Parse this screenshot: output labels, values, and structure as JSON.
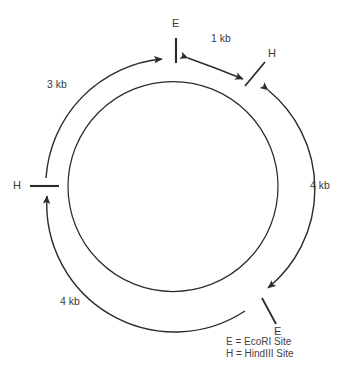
{
  "figure": {
    "type": "plasmid-restriction-map",
    "shape": "circular",
    "stroke_color": "#2b2b2b",
    "text_color": "#3a3a3a"
  },
  "sites": [
    {
      "id": "e-top",
      "label": "E",
      "enzyme": "EcoRI",
      "position": "top",
      "tick": "vertical"
    },
    {
      "id": "h-upper-right",
      "label": "H",
      "enzyme": "HindIII",
      "position": "upper-right",
      "tick": "diagonal"
    },
    {
      "id": "e-lower-right",
      "label": "E",
      "enzyme": "EcoRI",
      "position": "lower-right",
      "tick": "diagonal"
    },
    {
      "id": "h-left",
      "label": "H",
      "enzyme": "HindIII",
      "position": "left",
      "tick": "horizontal"
    }
  ],
  "segments": [
    {
      "id": "seg-1kb",
      "label": "1 kb",
      "from": "e-top",
      "to": "h-upper-right",
      "arc": "top-right"
    },
    {
      "id": "seg-4kb-right",
      "label": "4 kb",
      "from": "h-upper-right",
      "to": "e-lower-right",
      "arc": "right"
    },
    {
      "id": "seg-4kb-bottom",
      "label": "4 kb",
      "from": "e-lower-right",
      "to": "h-left",
      "arc": "bottom-left"
    },
    {
      "id": "seg-3kb",
      "label": "3 kb",
      "from": "h-left",
      "to": "e-top",
      "arc": "upper-left"
    }
  ],
  "legend": {
    "lines": [
      "E = EcoRI Site",
      "H = HindIII Site"
    ]
  }
}
